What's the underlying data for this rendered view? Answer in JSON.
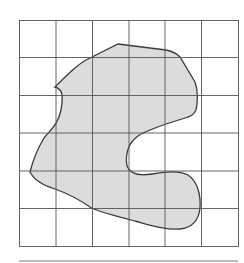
{
  "caption": "",
  "figure": {
    "grid": {
      "columns": 6,
      "rows": 6
    },
    "shape_fill": "#dcdcdc",
    "shape_stroke": "#3a3a3a",
    "grid_stroke": "#555555"
  }
}
